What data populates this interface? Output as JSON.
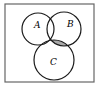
{
  "diagram": {
    "type": "venn",
    "sets": [
      {
        "label": "A",
        "cx": 38,
        "cy": 29,
        "r": 16
      },
      {
        "label": "B",
        "cx": 64,
        "cy": 29,
        "r": 17
      },
      {
        "label": "C",
        "cx": 54,
        "cy": 60,
        "r": 20
      }
    ],
    "shaded_region": "B ∩ C − A",
    "colors": {
      "stroke": "#1a1a1a",
      "shade": "#a9a9a9",
      "border": "#555555",
      "background": "#ffffff"
    }
  }
}
